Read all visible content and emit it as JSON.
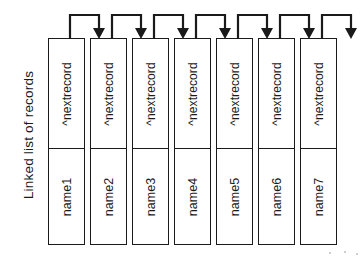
{
  "figure": {
    "caption": "Linked list of records",
    "caption_orientation": "vertical-rotated-90",
    "record_count": 7,
    "pointer_field_label": "^nextrecord",
    "records": [
      {
        "name": "name1",
        "next": "^nextrecord"
      },
      {
        "name": "name2",
        "next": "^nextrecord"
      },
      {
        "name": "name3",
        "next": "^nextrecord"
      },
      {
        "name": "name4",
        "next": "^nextrecord"
      },
      {
        "name": "name5",
        "next": "^nextrecord"
      },
      {
        "name": "name6",
        "next": "^nextrecord"
      },
      {
        "name": "name7",
        "next": "^nextrecord"
      }
    ],
    "arrows": [
      {
        "from": "name1",
        "to": "name2"
      },
      {
        "from": "name2",
        "to": "name3"
      },
      {
        "from": "name3",
        "to": "name4"
      },
      {
        "from": "name4",
        "to": "name5"
      },
      {
        "from": "name5",
        "to": "name6"
      },
      {
        "from": "name6",
        "to": "name7"
      },
      {
        "from": "name7",
        "to": "null"
      }
    ],
    "colors": {
      "ink": "#1a1a1a",
      "paper": "#ffffff"
    }
  }
}
